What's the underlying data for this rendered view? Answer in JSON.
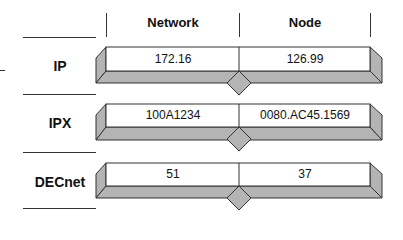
{
  "headers": {
    "network": "Network",
    "node": "Node"
  },
  "rows": [
    {
      "protocol": "IP",
      "network": "172.16",
      "node": "126.99"
    },
    {
      "protocol": "IPX",
      "network": "100A1234",
      "node": "0080.AC45.1569"
    },
    {
      "protocol": "DECnet",
      "network": "51",
      "node": "37"
    }
  ],
  "colors": {
    "bar_face": "#ffffff",
    "bar_shade": "#b4b4b4",
    "outline": "#333333"
  }
}
